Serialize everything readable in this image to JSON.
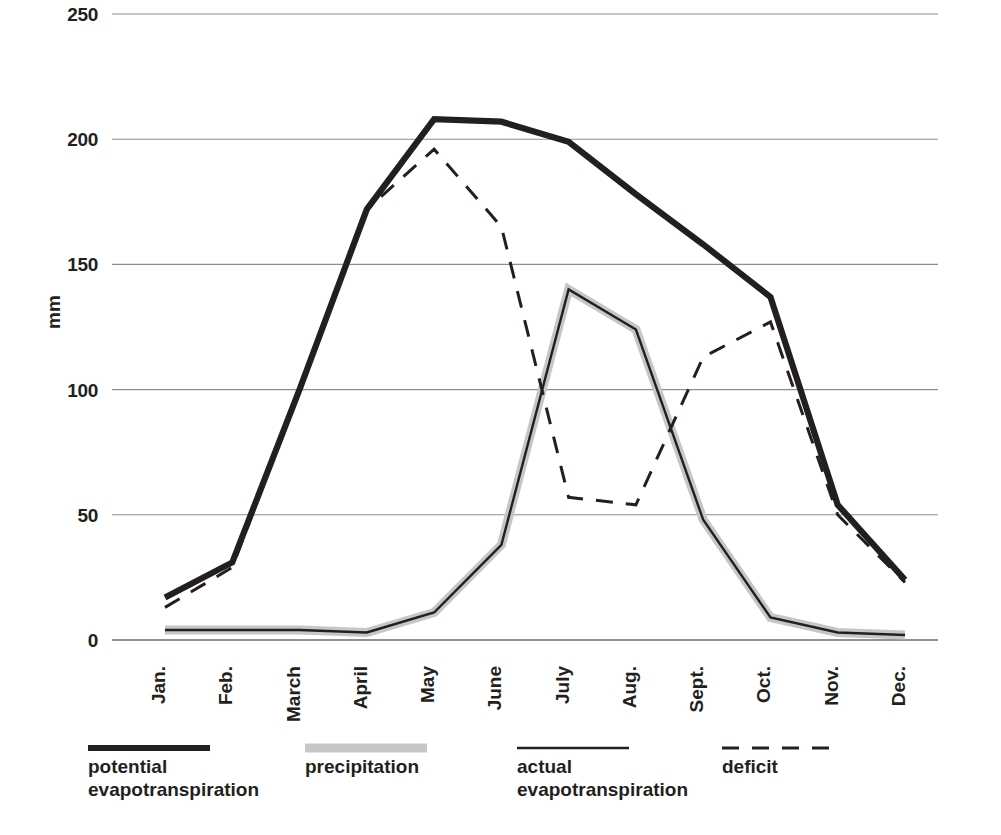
{
  "chart_data": {
    "type": "line",
    "title": "",
    "xlabel": "",
    "ylabel": "mm",
    "ylim": [
      0,
      250
    ],
    "yticks": [
      0,
      50,
      100,
      150,
      200,
      250
    ],
    "grid": true,
    "legend_position": "bottom",
    "categories": [
      "Jan.",
      "Feb.",
      "March",
      "April",
      "May",
      "June",
      "July",
      "Aug.",
      "Sept.",
      "Oct.",
      "Nov.",
      "Dec."
    ],
    "series": [
      {
        "name": "potential evapotranspiration",
        "style": "thick-solid-dark",
        "color": "#231f20",
        "values": [
          17,
          31,
          100,
          172,
          208,
          207,
          199,
          178,
          158,
          137,
          54,
          24
        ]
      },
      {
        "name": "precipitation",
        "style": "thick-solid-gray",
        "color": "#c6c6c6",
        "values": [
          4,
          4,
          4,
          3,
          11,
          38,
          140,
          124,
          48,
          9,
          3,
          2
        ]
      },
      {
        "name": "actual evapotranspiration",
        "style": "thin-solid-dark",
        "color": "#231f20",
        "values": [
          4,
          4,
          4,
          3,
          11,
          38,
          140,
          124,
          48,
          9,
          3,
          2
        ]
      },
      {
        "name": "deficit",
        "style": "dashed-dark",
        "color": "#231f20",
        "values": [
          13,
          29,
          100,
          172,
          196,
          165,
          57,
          54,
          113,
          127,
          50,
          23
        ]
      }
    ]
  },
  "axis": {
    "y_title": "mm",
    "y_tick_labels": [
      "250",
      "200",
      "150",
      "100",
      "50",
      "0"
    ],
    "x_tick_labels": [
      "Jan.",
      "Feb.",
      "March",
      "April",
      "May",
      "June",
      "July",
      "Aug.",
      "Sept.",
      "Oct.",
      "Nov.",
      "Dec."
    ]
  },
  "legend": {
    "items": [
      {
        "label_line1": "potential",
        "label_line2": "evapotranspiration",
        "swatch": "thick-dark-line-swatch"
      },
      {
        "label_line1": "precipitation",
        "label_line2": "",
        "swatch": "thick-gray-line-swatch"
      },
      {
        "label_line1": "actual",
        "label_line2": "evapotranspiration",
        "swatch": "thin-dark-line-swatch"
      },
      {
        "label_line1": "deficit",
        "label_line2": "",
        "swatch": "dashed-dark-line-swatch"
      }
    ]
  },
  "colors": {
    "dark": "#231f20",
    "gray": "#c6c6c6",
    "grid": "#8e8e8e",
    "background": "#ffffff"
  }
}
